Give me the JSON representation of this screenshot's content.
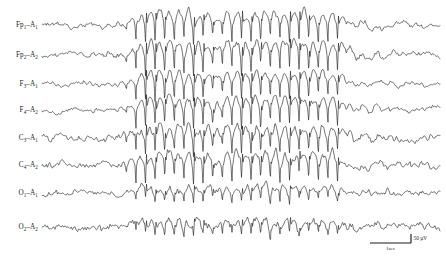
{
  "figure": {
    "background_color": "#ffffff",
    "trace_color": "#1b1b1b",
    "width": 446,
    "height": 268
  },
  "calibration": {
    "amplitude_label": "50 µV",
    "time_label": "1sec",
    "amplitude_value": 50,
    "amplitude_unit": "µV",
    "time_value": 1,
    "time_unit": "sec",
    "bar_x_start": 370,
    "bar_x_end": 411,
    "bar_y": 243,
    "tick_height": 9
  },
  "chart_data": {
    "type": "line",
    "xlabel": "Time",
    "ylabel": "Channel",
    "grid": false,
    "legend_position": "left",
    "x_range_sec": [
      0,
      10.6
    ],
    "sampling_note": "Traces are multi-channel EEG time series; amplitude scale 50 microvolts, time scale 1 second.",
    "burst": {
      "onset_x": 135,
      "offset_x": 346,
      "description": "high-amplitude rhythmic spike-and-wave complexes, approximately 3 Hz, generalized across all channels",
      "mid_attenuation_x": [
        204,
        232
      ],
      "frequency_hz": 3
    },
    "categories": [
      "Fp1-A1",
      "Fp2-A2",
      "F3-A1",
      "F4-A2",
      "C3-A1",
      "C4-A2",
      "O1-A1",
      "O2-A2"
    ],
    "series": [
      {
        "name": "Fp1-A1",
        "label_main": "Fp",
        "label_sub1": "1",
        "label_ref": "A",
        "label_sub2": "1",
        "baseline_y": 25,
        "background_amp": 4.0,
        "burst_amp": 17.0,
        "tail_amp": 9.5,
        "seed": 11,
        "spiky": 0.85
      },
      {
        "name": "Fp2-A2",
        "label_main": "Fp",
        "label_sub1": "2",
        "label_ref": "A",
        "label_sub2": "2",
        "baseline_y": 55,
        "background_amp": 4.2,
        "burst_amp": 17.5,
        "tail_amp": 9.0,
        "seed": 23,
        "spiky": 0.9
      },
      {
        "name": "F3-A1",
        "label_main": "F",
        "label_sub1": "3",
        "label_ref": "A",
        "label_sub2": "1",
        "baseline_y": 84,
        "background_amp": 3.2,
        "burst_amp": 16.0,
        "tail_amp": 8.5,
        "seed": 37,
        "spiky": 0.8
      },
      {
        "name": "F4-A2",
        "label_main": "F",
        "label_sub1": "4",
        "label_ref": "A",
        "label_sub2": "2",
        "baseline_y": 110,
        "background_amp": 3.8,
        "burst_amp": 16.5,
        "tail_amp": 8.8,
        "seed": 49,
        "spiky": 0.85
      },
      {
        "name": "C3-A1",
        "label_main": "C",
        "label_sub1": "3",
        "label_ref": "A",
        "label_sub2": "1",
        "baseline_y": 138,
        "background_amp": 4.6,
        "burst_amp": 15.0,
        "tail_amp": 7.5,
        "seed": 61,
        "spiky": 1.0
      },
      {
        "name": "C4-A2",
        "label_main": "C",
        "label_sub1": "4",
        "label_ref": "A",
        "label_sub2": "2",
        "baseline_y": 165,
        "background_amp": 4.8,
        "burst_amp": 15.5,
        "tail_amp": 7.8,
        "seed": 73,
        "spiky": 1.0
      },
      {
        "name": "O1-A1",
        "label_main": "O",
        "label_sub1": "1",
        "label_ref": "A",
        "label_sub2": "1",
        "baseline_y": 193,
        "background_amp": 3.4,
        "burst_amp": 8.0,
        "tail_amp": 4.4,
        "seed": 85,
        "spiky": 1.25
      },
      {
        "name": "O2-A2",
        "label_main": "O",
        "label_sub1": "2",
        "label_ref": "A",
        "label_sub2": "2",
        "baseline_y": 227,
        "background_amp": 3.6,
        "burst_amp": 7.5,
        "tail_amp": 4.2,
        "seed": 97,
        "spiky": 1.25
      }
    ]
  },
  "layout": {
    "label_x": 38,
    "trace_x_start": 42,
    "trace_x_end": 440
  }
}
